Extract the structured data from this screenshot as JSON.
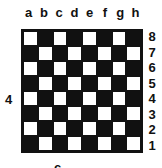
{
  "diagram": {
    "type": "chessboard",
    "files": [
      "a",
      "b",
      "c",
      "d",
      "e",
      "f",
      "g",
      "h"
    ],
    "ranks": [
      "8",
      "7",
      "6",
      "5",
      "4",
      "3",
      "2",
      "1"
    ],
    "top_left_square_color": "light",
    "colors": {
      "light": "#ffffff",
      "dark": "#111111"
    },
    "side_label": "4",
    "bottom_label": "c"
  }
}
